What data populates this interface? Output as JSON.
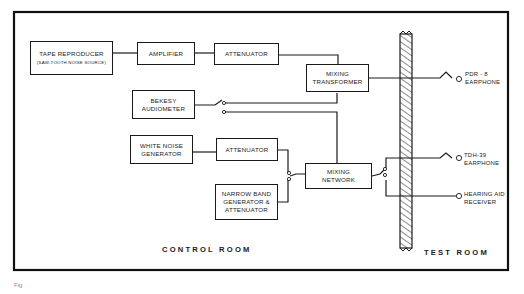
{
  "diagram": {
    "blocks": {
      "tape_reproducer": {
        "title": "TAPE REPRODUCER",
        "subtitle": "(SAW-TOOTH NOISE SOURCE)"
      },
      "amplifier": {
        "title": "AMPLIFIER"
      },
      "attenuator_top": {
        "title": "ATTENUATOR"
      },
      "mixing_transformer": {
        "line1": "MIXING",
        "line2": "TRANSFORMER"
      },
      "bekesy_audiometer": {
        "line1": "BEKESY",
        "line2": "AUDIOMETER"
      },
      "white_noise_generator": {
        "line1": "WHITE NOISE",
        "line2": "GENERATOR"
      },
      "attenuator_mid": {
        "title": "ATTENUATOR"
      },
      "narrow_band": {
        "line1": "NARROW BAND",
        "line2": "GENERATOR &",
        "line3": "ATTENUATOR"
      },
      "mixing_network": {
        "line1": "MIXING",
        "line2": "NETWORK"
      }
    },
    "outputs": {
      "pdr8": {
        "line1": "PDR - 8",
        "line2": "EARPHONE"
      },
      "tdh39": {
        "line1": "TDH-39",
        "line2": "EARPHONE"
      },
      "hearing_aid": {
        "line1": "HEARING AID",
        "line2": "RECEIVER"
      }
    },
    "rooms": {
      "control": "CONTROL ROOM",
      "test": "TEST ROOM"
    },
    "caption": "Fig"
  }
}
